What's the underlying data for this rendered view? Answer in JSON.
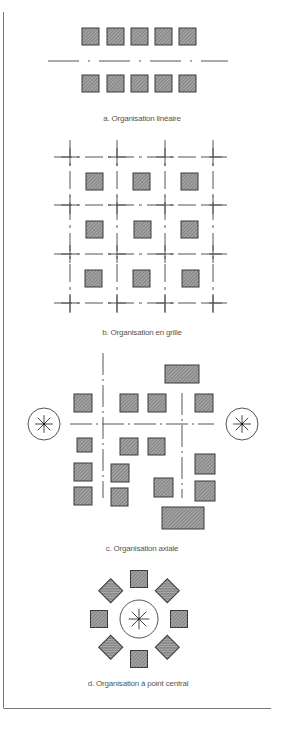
{
  "colors": {
    "line": "#555555",
    "square_fill": "#8a8a8a",
    "square_stroke": "#3a3a3a",
    "hatch": "#c8c8c8",
    "frame": "#777777",
    "background": "#ffffff"
  },
  "sections": [
    {
      "id": "a",
      "caption": "a. Organisation linéaire"
    },
    {
      "id": "b",
      "caption": "b. Organisation en grille"
    },
    {
      "id": "c",
      "caption": "c. Organisation axiale"
    },
    {
      "id": "d",
      "caption": "d. Organisation à point central"
    }
  ],
  "linear": {
    "squares_top": [
      [
        82,
        28,
        17,
        17
      ],
      [
        107,
        28,
        17,
        17
      ],
      [
        131,
        28,
        17,
        17
      ],
      [
        155,
        28,
        17,
        17
      ],
      [
        179,
        28,
        17,
        17
      ]
    ],
    "squares_bottom": [
      [
        82,
        75,
        17,
        17
      ],
      [
        107,
        75,
        17,
        17
      ],
      [
        131,
        75,
        17,
        17
      ],
      [
        155,
        75,
        17,
        17
      ],
      [
        179,
        75,
        17,
        17
      ]
    ],
    "axis": {
      "x1": 48,
      "x2": 228,
      "y": 61
    }
  },
  "grid": {
    "vlines_x": [
      70,
      117,
      165,
      213
    ],
    "hlines_y": [
      157,
      205,
      254,
      303
    ],
    "x_range": [
      54,
      231
    ],
    "y_range": [
      140,
      318
    ],
    "squares": [
      [
        86,
        173,
        17,
        17
      ],
      [
        133,
        173,
        17,
        17
      ],
      [
        181,
        173,
        17,
        17
      ],
      [
        86,
        221,
        17,
        17
      ],
      [
        134,
        221,
        17,
        17
      ],
      [
        181,
        221,
        17,
        17
      ],
      [
        85,
        270,
        17,
        17
      ],
      [
        133,
        270,
        17,
        17
      ],
      [
        182,
        270,
        17,
        17
      ]
    ]
  },
  "axial": {
    "vaxis_x": [
      103,
      182
    ],
    "vaxis1_y": [
      353,
      498
    ],
    "vaxis2_y": [
      393,
      498
    ],
    "haxis": {
      "x1": 70,
      "x2": 214,
      "y": 424
    },
    "centers": [
      {
        "cx": 44,
        "cy": 424,
        "r": 16
      },
      {
        "cx": 242,
        "cy": 424,
        "r": 16
      }
    ],
    "rects": [
      [
        165,
        365,
        34,
        18
      ],
      [
        74,
        394,
        18,
        18
      ],
      [
        120,
        394,
        18,
        18
      ],
      [
        148,
        394,
        18,
        18
      ],
      [
        195,
        394,
        18,
        18
      ],
      [
        77,
        438,
        15,
        14
      ],
      [
        120,
        438,
        18,
        17
      ],
      [
        148,
        438,
        17,
        17
      ],
      [
        74,
        463,
        18,
        18
      ],
      [
        111,
        464,
        18,
        18
      ],
      [
        195,
        454,
        20,
        20
      ],
      [
        74,
        487,
        18,
        18
      ],
      [
        111,
        488,
        17,
        18
      ],
      [
        154,
        478,
        19,
        19
      ],
      [
        195,
        481,
        20,
        20
      ],
      [
        162,
        507,
        42,
        22
      ]
    ]
  },
  "central": {
    "center": {
      "cx": 139,
      "cy": 619,
      "r": 19
    },
    "orbit_r": 40,
    "square_size": 17
  }
}
